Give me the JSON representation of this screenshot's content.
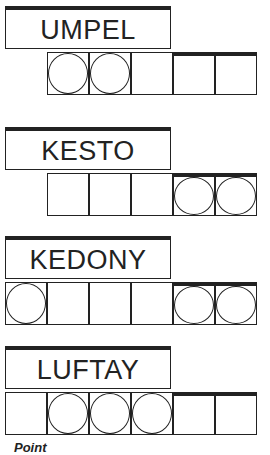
{
  "puzzles": [
    {
      "word": "UMPEL",
      "top": 6,
      "cells": [
        null,
        "circle",
        "circle",
        "empty",
        "empty",
        "empty"
      ]
    },
    {
      "word": "KESTO",
      "top": 127,
      "cells": [
        null,
        "empty",
        "empty",
        "empty",
        "circle",
        "circle"
      ]
    },
    {
      "word": "KEDONY",
      "top": 236,
      "cells": [
        "circle",
        "empty",
        "empty",
        "empty",
        "circle",
        "circle"
      ]
    },
    {
      "word": "LUFTAY",
      "top": 346,
      "cells": [
        "empty",
        "circle",
        "circle",
        "circle",
        "empty",
        "empty"
      ]
    }
  ],
  "footer": {
    "text": "Point"
  }
}
